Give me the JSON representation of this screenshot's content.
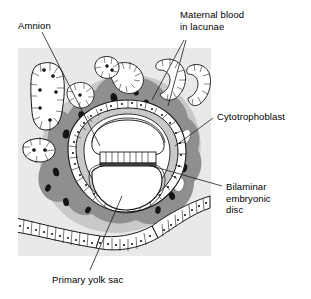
{
  "figure": {
    "type": "histological-diagram"
  },
  "labels": {
    "amnion": "Amnion",
    "maternal_blood": "Maternal blood\nin lacunae",
    "cytotrophoblast": "Cytotrophoblast",
    "bilaminar_disc": "Bilaminar\nembryonic\ndisc",
    "primary_yolk_sac": "Primary yolk sac"
  },
  "colors": {
    "background": "#ffffff",
    "panel": "#e9e9e9",
    "syncytiotrophoblast": "#8f8f8f",
    "extraembryonic_mesoderm": "#c9c9c9",
    "lacuna": "#141414",
    "cell_fill": "#ffffff",
    "outline": "#1a1a1a",
    "text": "#000000"
  },
  "structures": [
    {
      "name": "endometrial-stroma-panel",
      "shade": "light-gray"
    },
    {
      "name": "syncytiotrophoblast-mass",
      "shade": "dark-gray"
    },
    {
      "name": "lacunae-maternal-blood",
      "shade": "black"
    },
    {
      "name": "cytotrophoblast-ring",
      "shade": "white-cuboidal-cells"
    },
    {
      "name": "amniotic-cavity",
      "shade": "white"
    },
    {
      "name": "bilaminar-embryonic-disc",
      "shade": "columnar-cell-row"
    },
    {
      "name": "primary-yolk-sac-cavity",
      "shade": "white"
    },
    {
      "name": "uterine-glands",
      "shade": "white-lined"
    },
    {
      "name": "maternal-sinusoids",
      "shade": "white-lined-tubules"
    },
    {
      "name": "endometrial-surface-epithelium",
      "shade": "white-columnar-row"
    }
  ]
}
